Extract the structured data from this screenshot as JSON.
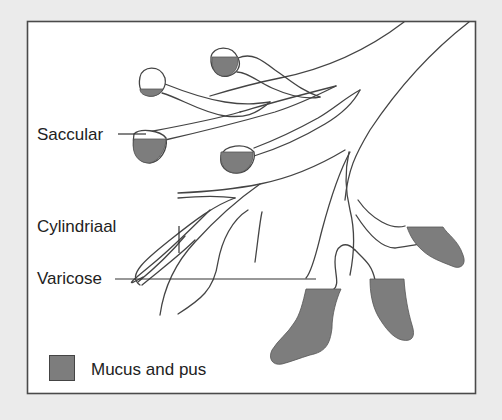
{
  "diagram": {
    "labels": {
      "saccular": "Saccular",
      "cylindrical": "Cylindriaal",
      "varicose": "Varicose"
    },
    "legend": {
      "items": [
        {
          "label": "Mucus and pus",
          "color": "#7d7d7d"
        }
      ]
    },
    "colors": {
      "background": "#ebebeb",
      "panel": "#ffffff",
      "outline": "#444444",
      "fill": "#7d7d7d"
    }
  }
}
